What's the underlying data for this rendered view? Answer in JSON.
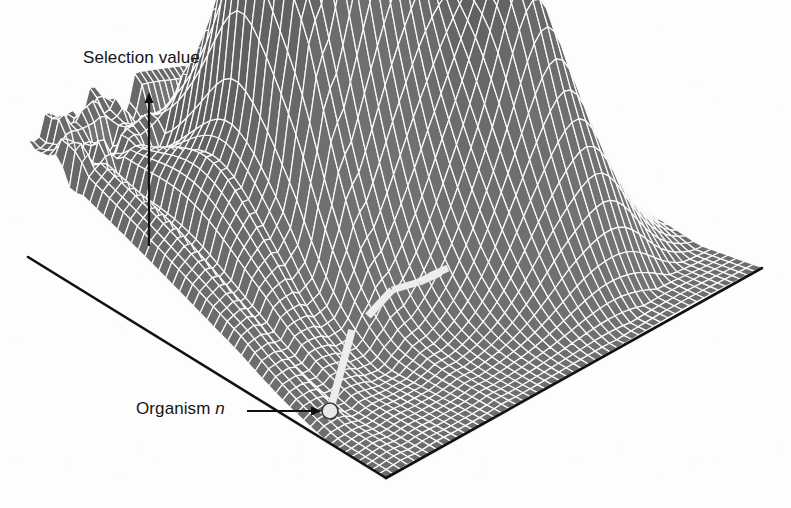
{
  "figure": {
    "title_text": "",
    "axis_label": "Selection value",
    "point_label_prefix": "Organism",
    "point_label_symbol": "n",
    "background_color": "#fdfdfd",
    "ink_color": "#151515",
    "mesh_face_color": "#6e6e6e",
    "mesh_line_color": "#fafafa",
    "marker_fill_color": "#e8e8e8",
    "marker_stroke_color": "#3a3a3a",
    "path_color": "#ededed",
    "path_stroke_color": "#9a9a9a"
  },
  "chart_data": {
    "type": "surface",
    "title": "",
    "zlabel": "Selection value",
    "annotations": [
      {
        "text": "Selection value",
        "type": "axis-arrow",
        "x": 149,
        "y_from": 246,
        "y_to": 92
      },
      {
        "text": "Organism n",
        "type": "pointer-arrow",
        "x_from": 247,
        "x_to": 322,
        "y": 411
      }
    ],
    "markers": [
      {
        "name": "organism-n",
        "x": 330,
        "y": 411,
        "r": 8
      }
    ],
    "base_quad": [
      {
        "x": 28,
        "y": 257
      },
      {
        "x": 320,
        "y": 118
      },
      {
        "x": 762,
        "y": 268
      },
      {
        "x": 386,
        "y": 478
      }
    ],
    "grid": {
      "u_divisions": 52,
      "v_divisions": 52,
      "shown": true
    },
    "peaks": [
      {
        "name": "left-ridge",
        "x": 254,
        "y": 124,
        "height": 0.62
      },
      {
        "name": "center-left",
        "x": 345,
        "y": 62,
        "height": 0.88
      },
      {
        "name": "center-minor",
        "x": 398,
        "y": 95,
        "height": 0.74
      },
      {
        "name": "tall-peak",
        "x": 510,
        "y": 34,
        "height": 1.0
      },
      {
        "name": "right-shoulder",
        "x": 556,
        "y": 108,
        "height": 0.7
      },
      {
        "name": "right-peak",
        "x": 600,
        "y": 126,
        "height": 0.66
      },
      {
        "name": "far-right",
        "x": 645,
        "y": 168,
        "height": 0.48
      }
    ],
    "trajectory": {
      "name": "adaptive-walk",
      "points": [
        {
          "x": 330,
          "y": 411
        },
        {
          "x": 352,
          "y": 330
        },
        {
          "x": 368,
          "y": 316
        },
        {
          "x": 392,
          "y": 290
        },
        {
          "x": 419,
          "y": 282
        },
        {
          "x": 441,
          "y": 272
        }
      ]
    }
  }
}
